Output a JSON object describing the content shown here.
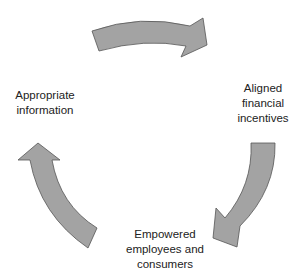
{
  "diagram": {
    "type": "cycle",
    "nodes": [
      {
        "id": "left",
        "label": "Appropriate\ninformation"
      },
      {
        "id": "right",
        "label": "Aligned\nfinancial\nincentives"
      },
      {
        "id": "bottom",
        "label": "Empowered\nemployees and\nconsumers"
      }
    ],
    "edges": [
      {
        "from": "left",
        "to": "right",
        "direction": "clockwise"
      },
      {
        "from": "right",
        "to": "bottom",
        "direction": "clockwise"
      },
      {
        "from": "bottom",
        "to": "left",
        "direction": "clockwise"
      }
    ],
    "colors": {
      "arrow_fill": "#a3a3a3",
      "arrow_stroke": "#555555",
      "text": "#222222",
      "background": "#ffffff"
    }
  }
}
